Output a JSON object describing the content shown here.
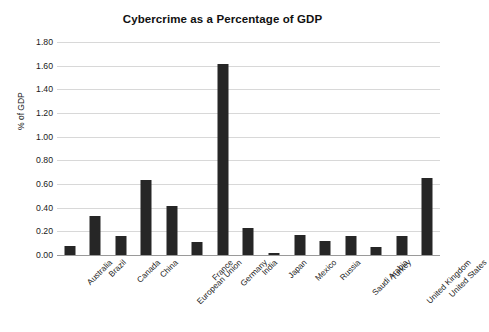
{
  "chart_data": {
    "type": "bar",
    "title": "Cybercrime as a Percentage of GDP",
    "xlabel": "",
    "ylabel": "% of GDP",
    "ylim": [
      0.0,
      1.8
    ],
    "ytick_step": 0.2,
    "ytick_labels": [
      "0.00",
      "0.20",
      "0.40",
      "0.60",
      "0.80",
      "1.00",
      "1.20",
      "1.40",
      "1.60",
      "1.80"
    ],
    "ytick_values": [
      0.0,
      0.2,
      0.4,
      0.6,
      0.8,
      1.0,
      1.2,
      1.4,
      1.6,
      1.8
    ],
    "grid": true,
    "legend": false,
    "legend_position": "none",
    "bar_color": "#262626",
    "gridline_color": "#d8d8d8",
    "categories": [
      "Australia",
      "Brazil",
      "Canada",
      "China",
      "European Union",
      "France",
      "Germany",
      "India",
      "Japan",
      "Mexico",
      "Russia",
      "Saudi Arabia",
      "Turkey",
      "United Kingdom",
      "United States"
    ],
    "values": [
      0.08,
      0.33,
      0.16,
      0.63,
      0.41,
      0.11,
      1.61,
      0.23,
      0.02,
      0.17,
      0.12,
      0.16,
      0.07,
      0.16,
      0.65
    ]
  }
}
